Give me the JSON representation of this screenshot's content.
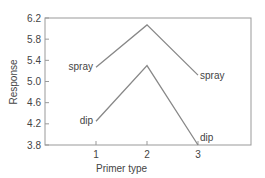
{
  "chart_data": {
    "type": "line",
    "title": "",
    "xlabel": "Primer type",
    "ylabel": "Response",
    "x": [
      1,
      2,
      3
    ],
    "xticks": [
      "1",
      "2",
      "3"
    ],
    "yticks": [
      "3.8",
      "4.2",
      "4.6",
      "5.0",
      "5.4",
      "5.8",
      "6.2"
    ],
    "ylim": [
      3.8,
      6.2
    ],
    "xlim": [
      0,
      4
    ],
    "grid": false,
    "legend": "inline labels at line ends",
    "series": [
      {
        "name": "spray",
        "values": [
          5.27,
          6.07,
          5.12
        ],
        "start_label": "spray",
        "end_label": "spray"
      },
      {
        "name": "dip",
        "values": [
          4.25,
          5.3,
          3.8
        ],
        "start_label": "dip",
        "end_label": "dip"
      }
    ]
  },
  "colors": {
    "line": "#888888",
    "axis": "#999999",
    "text": "#444444"
  }
}
